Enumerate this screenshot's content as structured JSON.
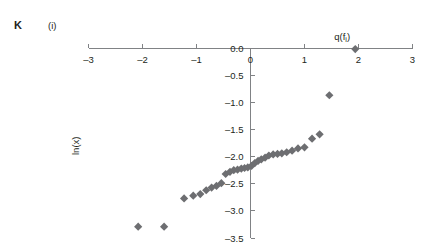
{
  "panel": {
    "letter": "K",
    "number": "(i)"
  },
  "colors": {
    "marker": "#6d6e71",
    "axis": "#808285",
    "text": "#231f20"
  },
  "chart_data": {
    "type": "scatter",
    "title": "",
    "subtitle": "",
    "xlabel": "q(f",
    "xlabel_sub": "i",
    "xlabel_suffix": ")",
    "xlabel_full": "q(f_i)",
    "ylabel": "ln(x)",
    "xlim": [
      -3,
      3
    ],
    "ylim": [
      -3.5,
      0.0
    ],
    "xticks": [
      -3,
      -2,
      -1,
      0,
      1,
      2,
      3
    ],
    "xtick_labels": [
      "–3",
      "–2",
      "–1",
      "0",
      "1",
      "2",
      "3"
    ],
    "yticks": [
      0.0,
      -0.5,
      -1.0,
      -1.5,
      -2.0,
      -2.5,
      -3.0,
      -3.5
    ],
    "ytick_labels": [
      "0.0",
      "–0.5",
      "–1.0",
      "–1.5",
      "–2.0",
      "–2.5",
      "–3.0",
      "–3.5"
    ],
    "grid": false,
    "legend": null,
    "marker_shape": "diamond",
    "marker_size": 7,
    "series": [
      {
        "name": "ln(x) normal quantile plot",
        "points": [
          [
            -2.08,
            -3.29
          ],
          [
            -1.6,
            -3.29
          ],
          [
            -1.23,
            -2.77
          ],
          [
            -1.06,
            -2.72
          ],
          [
            -0.93,
            -2.69
          ],
          [
            -0.82,
            -2.62
          ],
          [
            -0.72,
            -2.57
          ],
          [
            -0.63,
            -2.54
          ],
          [
            -0.54,
            -2.49
          ],
          [
            -0.46,
            -2.32
          ],
          [
            -0.38,
            -2.28
          ],
          [
            -0.31,
            -2.25
          ],
          [
            -0.24,
            -2.24
          ],
          [
            -0.17,
            -2.22
          ],
          [
            -0.11,
            -2.21
          ],
          [
            -0.05,
            -2.2
          ],
          [
            0.02,
            -2.17
          ],
          [
            0.08,
            -2.12
          ],
          [
            0.14,
            -2.08
          ],
          [
            0.2,
            -2.05
          ],
          [
            0.27,
            -2.02
          ],
          [
            0.34,
            -1.98
          ],
          [
            0.42,
            -1.96
          ],
          [
            0.5,
            -1.95
          ],
          [
            0.58,
            -1.94
          ],
          [
            0.67,
            -1.92
          ],
          [
            0.77,
            -1.89
          ],
          [
            0.88,
            -1.85
          ],
          [
            1.0,
            -1.83
          ],
          [
            1.14,
            -1.67
          ],
          [
            1.28,
            -1.59
          ],
          [
            1.46,
            -0.87
          ],
          [
            1.94,
            -0.02
          ]
        ]
      }
    ]
  }
}
